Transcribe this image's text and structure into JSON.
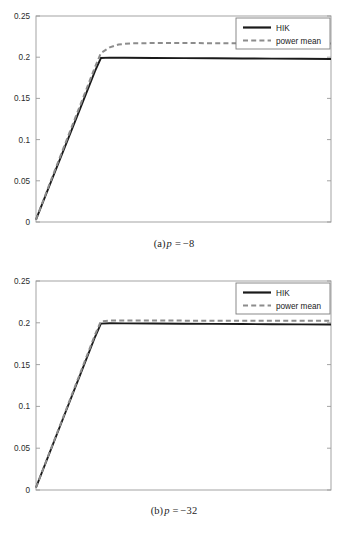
{
  "figure": {
    "panels": [
      {
        "id": "a",
        "caption_prefix": "(a)",
        "caption_var": "p",
        "caption_eq": "=",
        "caption_value": "−8"
      },
      {
        "id": "b",
        "caption_prefix": "(b)",
        "caption_var": "p",
        "caption_eq": "=",
        "caption_value": "−32"
      }
    ]
  },
  "colors": {
    "hik_line": "#1a1a1a",
    "power_mean_line": "#8c8c8c",
    "axis": "#9a9a9a",
    "background": "#ffffff",
    "text": "#1c1c1c"
  },
  "chart_data": [
    {
      "type": "line",
      "title": "",
      "panel": "(a) p = -8",
      "xlabel": "",
      "ylabel": "",
      "xlim": [
        0,
        1
      ],
      "ylim": [
        0,
        0.25
      ],
      "yticks": [
        0,
        0.05,
        0.1,
        0.15,
        0.2,
        0.25
      ],
      "ytick_labels": [
        "0",
        "0.05",
        "0.1",
        "0.15",
        "0.2",
        "0.25"
      ],
      "xticks": [],
      "xtick_labels": [],
      "grid": false,
      "legend_position": "upper right",
      "series": [
        {
          "name": "HIK",
          "style": "solid",
          "color": "#1a1a1a",
          "x": [
            0.0,
            0.05,
            0.1,
            0.15,
            0.2,
            0.22,
            0.25,
            0.3,
            0.4,
            0.5,
            0.6,
            0.7,
            0.8,
            0.9,
            1.0
          ],
          "y": [
            0.003,
            0.048,
            0.093,
            0.138,
            0.183,
            0.199,
            0.1995,
            0.1993,
            0.1991,
            0.1989,
            0.1987,
            0.1985,
            0.1983,
            0.1981,
            0.1979
          ]
        },
        {
          "name": "power mean",
          "style": "dashed",
          "color": "#8c8c8c",
          "x": [
            0.0,
            0.05,
            0.1,
            0.15,
            0.2,
            0.22,
            0.25,
            0.28,
            0.32,
            0.4,
            0.5,
            0.6,
            0.7,
            0.8,
            0.9,
            1.0
          ],
          "y": [
            0.003,
            0.05,
            0.096,
            0.142,
            0.188,
            0.205,
            0.212,
            0.2155,
            0.2168,
            0.2172,
            0.2172,
            0.217,
            0.2169,
            0.2168,
            0.2167,
            0.2166
          ]
        }
      ]
    },
    {
      "type": "line",
      "title": "",
      "panel": "(b) p = -32",
      "xlabel": "",
      "ylabel": "",
      "xlim": [
        0,
        1
      ],
      "ylim": [
        0,
        0.25
      ],
      "yticks": [
        0,
        0.05,
        0.1,
        0.15,
        0.2,
        0.25
      ],
      "ytick_labels": [
        "0",
        "0.05",
        "0.1",
        "0.15",
        "0.2",
        "0.25"
      ],
      "xticks": [],
      "xtick_labels": [],
      "grid": false,
      "legend_position": "upper right",
      "series": [
        {
          "name": "HIK",
          "style": "solid",
          "color": "#1a1a1a",
          "x": [
            0.0,
            0.05,
            0.1,
            0.15,
            0.2,
            0.22,
            0.25,
            0.3,
            0.4,
            0.5,
            0.6,
            0.7,
            0.8,
            0.9,
            1.0
          ],
          "y": [
            0.003,
            0.048,
            0.093,
            0.138,
            0.183,
            0.199,
            0.1995,
            0.1993,
            0.1991,
            0.1989,
            0.1987,
            0.1985,
            0.1983,
            0.1981,
            0.1979
          ]
        },
        {
          "name": "power mean",
          "style": "dashed",
          "color": "#8c8c8c",
          "x": [
            0.0,
            0.05,
            0.1,
            0.15,
            0.2,
            0.22,
            0.25,
            0.3,
            0.4,
            0.5,
            0.6,
            0.7,
            0.8,
            0.9,
            1.0
          ],
          "y": [
            0.003,
            0.0487,
            0.0943,
            0.14,
            0.1857,
            0.2018,
            0.2026,
            0.2027,
            0.2027,
            0.2026,
            0.2026,
            0.2025,
            0.2025,
            0.2024,
            0.2024
          ]
        }
      ]
    }
  ],
  "legend": {
    "items": [
      {
        "label": "HIK",
        "style": "solid",
        "color": "#1a1a1a"
      },
      {
        "label": "power mean",
        "style": "dashed",
        "color": "#8c8c8c"
      }
    ]
  }
}
